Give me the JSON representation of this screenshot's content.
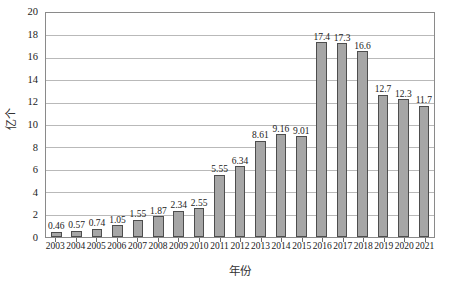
{
  "chart_data": {
    "type": "bar",
    "title": "",
    "xlabel": "年份",
    "ylabel": "亿个",
    "ylim": [
      0,
      20
    ],
    "ytick_step": 2,
    "yticks": [
      "0",
      "2",
      "4",
      "6",
      "8",
      "10",
      "12",
      "14",
      "16",
      "18",
      "20"
    ],
    "grid": true,
    "legend": "none",
    "bar_fill_color": "#a6a6a6",
    "bar_border_color": "#4d4d4d",
    "gridline_color": "#b9b9b9",
    "frame_color": "#8a8a8a",
    "categories": [
      "2003",
      "2004",
      "2005",
      "2006",
      "2007",
      "2008",
      "2009",
      "2010",
      "2011",
      "2012",
      "2013",
      "2014",
      "2015",
      "2016",
      "2017",
      "2018",
      "2019",
      "2020",
      "2021"
    ],
    "values": [
      0.46,
      0.57,
      0.74,
      1.05,
      1.55,
      1.87,
      2.34,
      2.55,
      5.55,
      6.34,
      8.61,
      9.16,
      9.01,
      17.4,
      17.3,
      16.6,
      12.7,
      12.3,
      11.7
    ],
    "value_labels": [
      "0.46",
      "0.57",
      "0.74",
      "1.05",
      "1.55",
      "1.87",
      "2.34",
      "2.55",
      "5.55",
      "6.34",
      "8.61",
      "9.16",
      "9.01",
      "17.4",
      "17.3",
      "16.6",
      "12.7",
      "12.3",
      "11.7"
    ]
  }
}
